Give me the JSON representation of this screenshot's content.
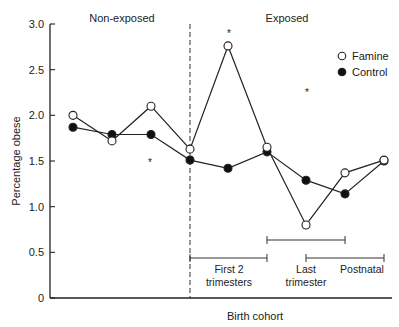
{
  "chart_data": {
    "type": "line",
    "title": "",
    "xlabel": "Birth cohort",
    "ylabel": "Percentage obese",
    "ylim": [
      0,
      3.0
    ],
    "yticks": [
      "0",
      "0.5",
      "1.0",
      "1.5",
      "2.0",
      "2.5",
      "3.0"
    ],
    "grid": false,
    "legend_position": "upper right",
    "x": [
      1,
      2,
      3,
      4,
      5,
      6,
      7,
      8,
      9
    ],
    "series": [
      {
        "name": "Famine",
        "marker": "open-circle",
        "values": [
          2.0,
          1.72,
          2.1,
          1.63,
          2.76,
          1.65,
          0.8,
          1.37,
          1.51
        ]
      },
      {
        "name": "Control",
        "marker": "filled-circle",
        "values": [
          1.87,
          1.79,
          1.79,
          1.51,
          1.42,
          1.6,
          1.29,
          1.14,
          1.5
        ]
      }
    ],
    "annotations": {
      "region_labels": [
        {
          "text": "Non-exposed",
          "side": "left of dashed line"
        },
        {
          "text": "Exposed",
          "side": "right of dashed line"
        }
      ],
      "significance_markers": [
        {
          "symbol": "*",
          "near": "cohort 3 (below)"
        },
        {
          "symbol": "*",
          "near": "cohort 5 (above)"
        },
        {
          "symbol": "*",
          "near": "cohort 7 (above)"
        }
      ],
      "exposure_periods": [
        {
          "label": "First 2 trimesters",
          "from_cohort": 4,
          "to_cohort": 6
        },
        {
          "label": "Last trimester",
          "from_cohort": 6,
          "to_cohort": 8
        },
        {
          "label": "Postnatal",
          "from_cohort": 7,
          "to_cohort": 9
        }
      ],
      "divider_between": "cohort 4 (dashed vertical line)"
    }
  }
}
